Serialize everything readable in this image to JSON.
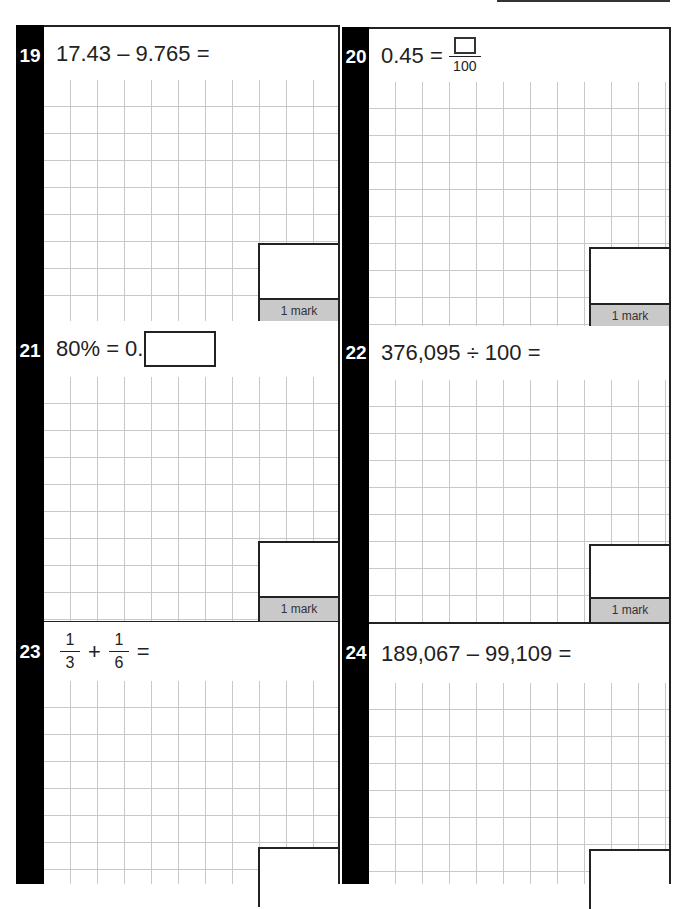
{
  "page": {
    "questions": [
      {
        "number": "19",
        "expression": "17.43 – 9.765 =",
        "mark_label": "1 mark"
      },
      {
        "number": "20",
        "expression_left": "0.45 =",
        "fraction": {
          "numerator": "answer-box",
          "denominator": "100"
        },
        "mark_label": "1 mark"
      },
      {
        "number": "21",
        "expression_left": "80% = 0.",
        "answer_box": "inline",
        "mark_label": "1 mark"
      },
      {
        "number": "22",
        "expression": "376,095 ÷ 100 =",
        "mark_label": "1 mark"
      },
      {
        "number": "23",
        "fraction_a": {
          "numerator": "1",
          "denominator": "3"
        },
        "operator": "+",
        "fraction_b": {
          "numerator": "1",
          "denominator": "6"
        },
        "equals": "=",
        "mark_label": "1 mark"
      },
      {
        "number": "24",
        "expression": "189,067 – 99,109 =",
        "mark_label": "1 mark"
      }
    ]
  },
  "colors": {
    "question_bar": "#000000",
    "mark_label_bg": "#c9c9c9",
    "grid_line": "#c8c8c8",
    "border": "#222222"
  }
}
